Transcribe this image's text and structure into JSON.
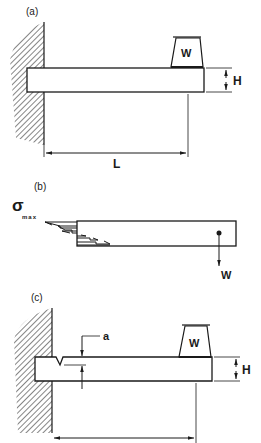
{
  "panels": {
    "a": {
      "label": "(a)",
      "weight_label": "W",
      "height_label": "H",
      "length_label": "L"
    },
    "b": {
      "label": "(b)",
      "stress_symbol": "σ",
      "stress_subscript": "max",
      "force_label": "W"
    },
    "c": {
      "label": "(c)",
      "crack_label": "a",
      "weight_label": "W",
      "height_label": "H"
    }
  },
  "colors": {
    "ink": "#1a1a1a",
    "background": "#ffffff"
  }
}
